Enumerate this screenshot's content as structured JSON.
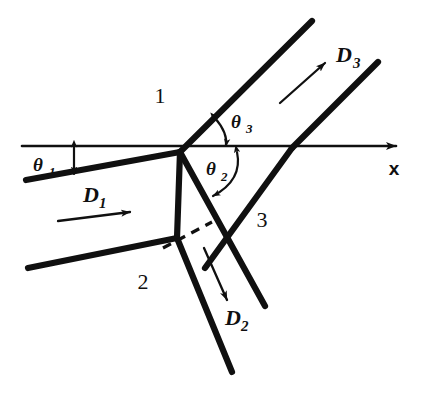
{
  "figure": {
    "background_color": "#ffffff",
    "ink_color": "#101010"
  },
  "axis": {
    "label": "x",
    "name": "horizontal-x-axis",
    "arrow_direction": "right"
  },
  "regions": [
    {
      "id": "region-1",
      "label": "1",
      "x": 160,
      "y": 98
    },
    {
      "id": "region-2",
      "label": "2",
      "x": 143,
      "y": 284
    },
    {
      "id": "region-3",
      "label": "3",
      "x": 262,
      "y": 222
    }
  ],
  "angles": [
    {
      "id": "theta-1",
      "symbol": "θ",
      "subscript": "1",
      "label": "θ1",
      "arrow_type": "double-headed-vertical",
      "between": [
        "x-axis",
        "incident-shock"
      ]
    },
    {
      "id": "theta-2",
      "symbol": "θ",
      "subscript": "2",
      "label": "θ2",
      "arrow_type": "double-headed-arc",
      "between": [
        "x-axis",
        "transmitted-shock-lower"
      ]
    },
    {
      "id": "theta-3",
      "symbol": "θ",
      "subscript": "3",
      "label": "θ3",
      "arrow_type": "double-headed-arc",
      "between": [
        "x-axis",
        "reflected-shock-upper"
      ]
    }
  ],
  "vectors": [
    {
      "id": "vector-D1",
      "symbol": "D",
      "subscript": "1",
      "label": "D1",
      "direction": "right",
      "region": "1"
    },
    {
      "id": "vector-D2",
      "symbol": "D",
      "subscript": "2",
      "label": "D2",
      "direction": "down-right",
      "region": "2"
    },
    {
      "id": "vector-D3",
      "symbol": "D",
      "subscript": "3",
      "label": "D3",
      "direction": "up-right",
      "region": "3"
    }
  ],
  "nodes": [
    {
      "id": "triple-point-upper",
      "x": 180,
      "y": 152
    },
    {
      "id": "triple-point-lower",
      "x": 177,
      "y": 237
    }
  ]
}
